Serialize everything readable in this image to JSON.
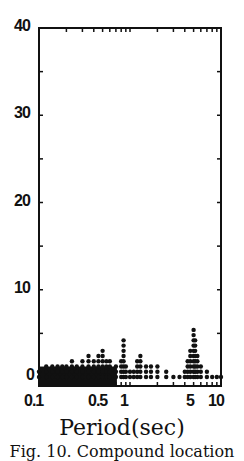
{
  "chart_data": {
    "type": "scatter",
    "title": "",
    "xlabel": "Period(sec)",
    "ylabel": "",
    "xscale": "log",
    "xlim": [
      0.1,
      10
    ],
    "ylim": [
      0,
      40
    ],
    "x_ticks": [
      "0.1",
      "0.5",
      "1",
      "5",
      "10"
    ],
    "y_ticks": [
      "0",
      "10",
      "20",
      "30",
      "40"
    ],
    "grid": false,
    "legend": null,
    "series": [
      {
        "name": "spectral values",
        "x": [
          0.1,
          0.12,
          0.14,
          0.16,
          0.18,
          0.2,
          0.23,
          0.26,
          0.3,
          0.35,
          0.4,
          0.45,
          0.5,
          0.55,
          0.6,
          0.7,
          0.8,
          0.85,
          0.9,
          1.0,
          1.1,
          1.2,
          1.3,
          1.5,
          1.7,
          2.0,
          2.5,
          3.0,
          3.5,
          4.0,
          4.3,
          4.6,
          5.0,
          5.2,
          5.5,
          6.0,
          7.0,
          8.0,
          9.0,
          10.0
        ],
        "y": [
          1.0,
          1.2,
          1.4,
          1.5,
          1.6,
          1.5,
          1.8,
          1.6,
          1.8,
          2.4,
          2.0,
          2.6,
          3.0,
          2.0,
          2.2,
          1.6,
          1.8,
          4.6,
          1.5,
          1.0,
          0.8,
          2.2,
          2.4,
          1.5,
          1.2,
          1.4,
          0.6,
          0.4,
          0.4,
          0.8,
          2.0,
          3.5,
          5.5,
          4.6,
          2.5,
          1.5,
          0.6,
          0.4,
          0.3,
          0.3
        ]
      }
    ],
    "annotations": []
  },
  "axis": {
    "x_title": "Period(sec)"
  },
  "caption": "Fig. 10. Compound location"
}
